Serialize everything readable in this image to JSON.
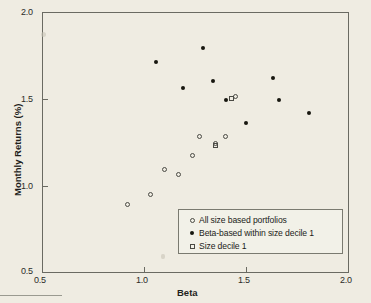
{
  "chart_data": {
    "type": "scatter",
    "title": "",
    "xlabel": "Beta",
    "ylabel": "Monthly Returns (%)",
    "xlim": [
      0.5,
      2.0
    ],
    "ylim": [
      0.5,
      2.0
    ],
    "xticks": [
      "0.5",
      "1.0",
      "1.5",
      "2.0"
    ],
    "xtick_values": [
      0.5,
      1.0,
      1.5,
      2.0
    ],
    "yticks": [
      "0.5",
      "1.0",
      "1.5",
      "2.0"
    ],
    "ytick_values": [
      0.5,
      1.0,
      1.5,
      2.0
    ],
    "grid": false,
    "legend_position": "lower right",
    "series": [
      {
        "name": "All size based portfolios",
        "marker": "open-circle",
        "color": "#4a4a44",
        "points": [
          {
            "x": 0.92,
            "y": 0.89
          },
          {
            "x": 1.03,
            "y": 0.95
          },
          {
            "x": 1.1,
            "y": 1.09
          },
          {
            "x": 1.17,
            "y": 1.06
          },
          {
            "x": 1.24,
            "y": 1.17
          },
          {
            "x": 1.27,
            "y": 1.28
          },
          {
            "x": 1.35,
            "y": 1.24
          },
          {
            "x": 1.4,
            "y": 1.28
          },
          {
            "x": 1.45,
            "y": 1.51
          }
        ]
      },
      {
        "name": "Beta-based within size decile 1",
        "marker": "filled-dot",
        "color": "#17170f",
        "points": [
          {
            "x": 1.06,
            "y": 1.71
          },
          {
            "x": 1.19,
            "y": 1.56
          },
          {
            "x": 1.29,
            "y": 1.79
          },
          {
            "x": 1.34,
            "y": 1.6
          },
          {
            "x": 1.4,
            "y": 1.49
          },
          {
            "x": 1.5,
            "y": 1.36
          },
          {
            "x": 1.63,
            "y": 1.62
          },
          {
            "x": 1.66,
            "y": 1.49
          },
          {
            "x": 1.81,
            "y": 1.42
          }
        ]
      },
      {
        "name": "Size decile 1",
        "marker": "open-square",
        "color": "#4a4a44",
        "points": [
          {
            "x": 1.35,
            "y": 1.23
          },
          {
            "x": 1.43,
            "y": 1.5
          }
        ]
      }
    ]
  },
  "legend": {
    "entries": [
      {
        "label": "All size based portfolios",
        "marker": "open-circle"
      },
      {
        "label": "Beta-based within size decile 1",
        "marker": "filled-dot"
      },
      {
        "label": "Size decile 1",
        "marker": "open-square"
      }
    ]
  }
}
